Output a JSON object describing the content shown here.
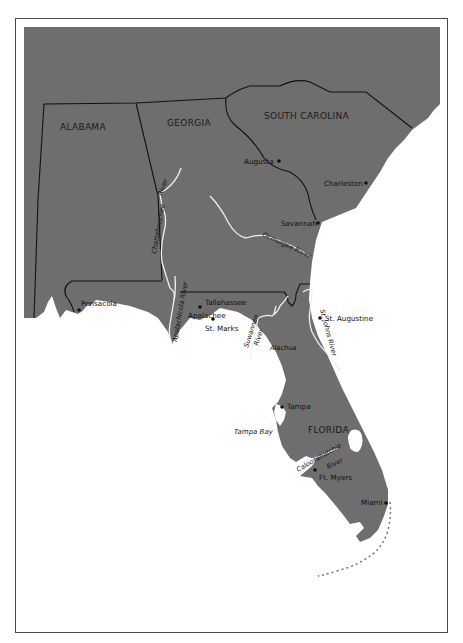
{
  "map": {
    "land_color": "#6e6e6e",
    "water_color": "#ffffff",
    "border_color": "#111111",
    "river_color": "#f2f2f2",
    "states": [
      {
        "name": "ALABAMA"
      },
      {
        "name": "GEORGIA"
      },
      {
        "name": "SOUTH CAROLINA"
      },
      {
        "name": "FLORIDA"
      }
    ],
    "cities": [
      {
        "name": "Augusta"
      },
      {
        "name": "Charleston"
      },
      {
        "name": "Savannah"
      },
      {
        "name": "Pensacola"
      },
      {
        "name": "Tallahassee"
      },
      {
        "name": "Apalachee"
      },
      {
        "name": "St. Marks"
      },
      {
        "name": "St. Augustine"
      },
      {
        "name": "Tampa"
      },
      {
        "name": "Ft. Myers"
      },
      {
        "name": "Miami"
      }
    ],
    "regions": [
      {
        "name": "Alachua"
      }
    ],
    "rivers": [
      {
        "name": "Chattahoochee"
      },
      {
        "name": "River"
      },
      {
        "name": "Ocmulgee River"
      },
      {
        "name": "Apalachicola River"
      },
      {
        "name": "Suwannee"
      },
      {
        "name": "River"
      },
      {
        "name": "St. Johns River"
      },
      {
        "name": "Caloosahatchie"
      },
      {
        "name": "River"
      }
    ],
    "water_bodies": [
      {
        "name": "Tampa Bay"
      }
    ]
  }
}
